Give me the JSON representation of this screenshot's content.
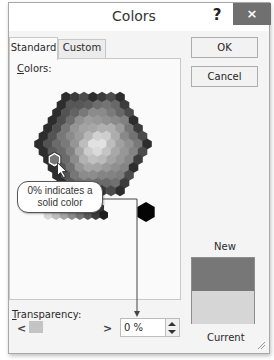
{
  "window": {
    "title": "Colors",
    "help_label": "?",
    "close_label": "×"
  },
  "tabs": [
    {
      "label": "Standard",
      "active": true
    },
    {
      "label": "Custom",
      "active": false
    }
  ],
  "standard_panel": {
    "colors_label_mnemonic": "C",
    "colors_label_rest": "olors:",
    "selected_hex": "#777777"
  },
  "callout": {
    "line1": "0% indicates a",
    "line2": "solid color"
  },
  "transparency": {
    "label_mnemonic": "T",
    "label_rest": "ransparency:",
    "left_arrow": "<",
    "right_arrow": ">",
    "value": "0 %"
  },
  "buttons": {
    "ok": "OK",
    "cancel": "Cancel"
  },
  "preview": {
    "new_label": "New",
    "current_label": "Current",
    "new_color": "#777777",
    "current_color": "#d6d6d6"
  }
}
